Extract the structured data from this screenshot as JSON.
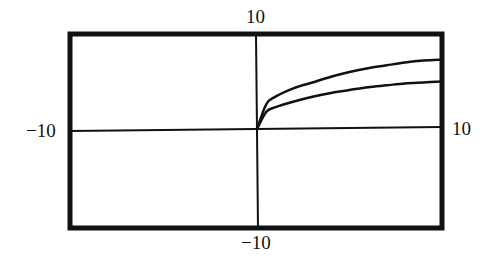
{
  "chart_data": {
    "type": "line",
    "title": "",
    "xlabel": "",
    "ylabel": "",
    "xlim": [
      -10,
      10
    ],
    "ylim": [
      -10,
      10
    ],
    "grid": false,
    "legend": null,
    "tick_labels": {
      "x_min": "−10",
      "x_max": "10",
      "y_min": "−10",
      "y_max": "10"
    },
    "series": [
      {
        "name": "upper curve",
        "x": [
          0,
          0.5,
          1,
          2,
          3,
          4,
          5,
          6,
          7,
          8,
          9,
          10
        ],
        "y": [
          0,
          2.6,
          3.4,
          4.3,
          4.9,
          5.5,
          6.0,
          6.4,
          6.7,
          7.0,
          7.2,
          7.3
        ]
      },
      {
        "name": "lower curve",
        "x": [
          0,
          0.5,
          1,
          2,
          3,
          4,
          5,
          6,
          7,
          8,
          9,
          10
        ],
        "y": [
          0,
          1.8,
          2.3,
          2.9,
          3.4,
          3.8,
          4.1,
          4.4,
          4.6,
          4.8,
          4.9,
          5.0
        ]
      }
    ]
  }
}
